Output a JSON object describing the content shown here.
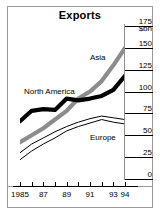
{
  "figure": {
    "title": "Exports",
    "unit_label": "$bn"
  },
  "axes": {
    "y_ticks": [
      "175",
      "150",
      "125",
      "100",
      "75",
      "50",
      "25",
      "0"
    ],
    "y_values": [
      175,
      150,
      125,
      100,
      75,
      50,
      25,
      0
    ],
    "x_ticks": [
      "1985",
      "87",
      "89",
      "91",
      "93",
      "94"
    ],
    "x_tick_values": [
      1985,
      1987,
      1989,
      1991,
      1993,
      1994
    ]
  },
  "series_labels": {
    "asia": "Asia",
    "north_america": "North America",
    "europe": "Europe"
  },
  "colors": {
    "asia": "#8c8c8c",
    "north_america": "#000000",
    "europe": "#000000",
    "frame": "#9a9a9a",
    "background": "#ffffff",
    "text": "#000000"
  },
  "chart_data": {
    "type": "line",
    "title": "Exports",
    "xlabel": "",
    "ylabel": "$bn",
    "xlim": [
      1985,
      1994
    ],
    "ylim": [
      0,
      175
    ],
    "grid": false,
    "legend_position": "inline-annotations",
    "x": [
      1985,
      1986,
      1987,
      1988,
      1989,
      1990,
      1991,
      1992,
      1993,
      1994
    ],
    "series": [
      {
        "name": "Asia",
        "color": "#8c8c8c",
        "style": "thick-grey",
        "values": [
          42,
          50,
          58,
          68,
          78,
          92,
          100,
          112,
          130,
          150
        ]
      },
      {
        "name": "North America",
        "color": "#000000",
        "style": "thick-black",
        "values": [
          66,
          78,
          80,
          79,
          92,
          90,
          92,
          95,
          102,
          118
        ]
      },
      {
        "name": "Europe",
        "color": "#000000",
        "style": "thin-band",
        "values": [
          22,
          32,
          40,
          47,
          55,
          60,
          64,
          68,
          65,
          63
        ]
      },
      {
        "name": "Europe (upper bound)",
        "color": "#000000",
        "style": "thin-band-upper",
        "values": [
          30,
          40,
          47,
          54,
          60,
          65,
          69,
          72,
          70,
          68
        ]
      }
    ]
  }
}
